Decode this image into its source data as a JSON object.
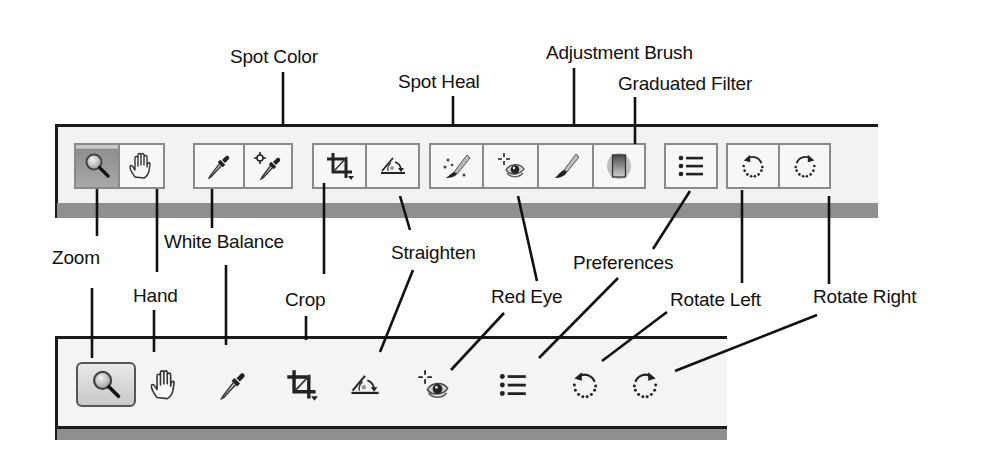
{
  "diagram": {
    "top_callouts": {
      "spot_color": "Spot Color",
      "spot_heal": "Spot Heal",
      "adjustment_brush": "Adjustment Brush",
      "graduated_filter": "Graduated Filter"
    },
    "middle_callouts": {
      "zoom": "Zoom",
      "white_balance": "White Balance",
      "hand": "Hand",
      "crop": "Crop",
      "straighten": "Straighten",
      "red_eye": "Red Eye",
      "preferences": "Preferences",
      "rotate_left": "Rotate Left",
      "rotate_right": "Rotate Right"
    }
  },
  "toolbar_full": {
    "tools": [
      {
        "id": "zoom",
        "icon": "magnifier-icon",
        "state": "pressed"
      },
      {
        "id": "hand",
        "icon": "hand-icon"
      },
      {
        "id": "white_balance",
        "icon": "eyedropper-icon"
      },
      {
        "id": "spot_color",
        "icon": "eyedropper-target-icon"
      },
      {
        "id": "crop",
        "icon": "crop-icon"
      },
      {
        "id": "straighten",
        "icon": "straighten-icon"
      },
      {
        "id": "spot_heal",
        "icon": "heal-brush-icon"
      },
      {
        "id": "red_eye",
        "icon": "red-eye-icon"
      },
      {
        "id": "adjustment_brush",
        "icon": "brush-icon"
      },
      {
        "id": "graduated_filter",
        "icon": "graduated-filter-icon"
      },
      {
        "id": "preferences",
        "icon": "list-icon"
      },
      {
        "id": "rotate_left",
        "icon": "rotate-left-icon"
      },
      {
        "id": "rotate_right",
        "icon": "rotate-right-icon"
      }
    ]
  },
  "toolbar_compact": {
    "tools": [
      {
        "id": "zoom",
        "icon": "magnifier-icon",
        "state": "pressed"
      },
      {
        "id": "hand",
        "icon": "hand-icon"
      },
      {
        "id": "white_balance",
        "icon": "eyedropper-icon"
      },
      {
        "id": "crop",
        "icon": "crop-icon"
      },
      {
        "id": "straighten",
        "icon": "straighten-icon"
      },
      {
        "id": "red_eye",
        "icon": "red-eye-icon"
      },
      {
        "id": "preferences",
        "icon": "list-icon"
      },
      {
        "id": "rotate_left",
        "icon": "rotate-left-icon"
      },
      {
        "id": "rotate_right",
        "icon": "rotate-right-icon"
      }
    ]
  },
  "colors": {
    "panel_bg": "#f2f2f2",
    "band": "#8f8f8f",
    "button_border": "#8a8a8a",
    "pressed_bg": "#a0a0a0",
    "line": "#111111"
  }
}
